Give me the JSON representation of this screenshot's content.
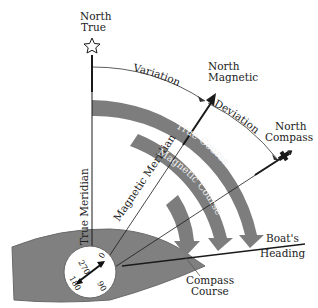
{
  "labels": {
    "north_true_1": "North",
    "north_true_2": "True",
    "north_magnetic_1": "North",
    "north_magnetic_2": "Magnetic",
    "north_compass_1": "North",
    "north_compass_2": "Compass",
    "variation": "Variation",
    "deviation": "Deviation",
    "true_meridian": "True Meridian",
    "magnetic_meridian": "Magnetic Meridian",
    "true_course": "True Course",
    "magnetic_course": "Magnetic Course",
    "compass_course_1": "Compass",
    "compass_course_2": "Course",
    "boats_heading_1": "Boat's",
    "boats_heading_2": "Heading"
  },
  "compass_dial": {
    "north": "0",
    "east": "90",
    "south": "180",
    "west": "270"
  },
  "colors": {
    "band": "#7d7d7d",
    "hull": "#808080",
    "line": "#1a1a1a",
    "background": "#ffffff"
  }
}
